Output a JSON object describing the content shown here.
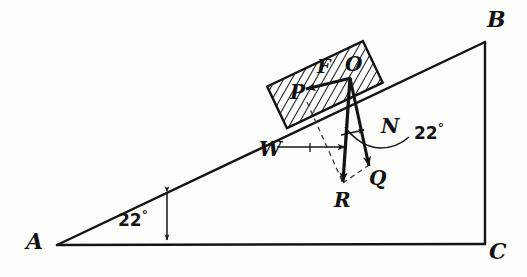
{
  "figure": {
    "background_color": "#fdfdfc",
    "stroke_color": "#141414",
    "block_fill_color": "#ffffff",
    "hatch_color": "#1a1a1a"
  },
  "vertices": {
    "A": {
      "label": "A",
      "x": 57,
      "y": 245
    },
    "B": {
      "label": "B",
      "x": 485,
      "y": 42
    },
    "C": {
      "label": "C",
      "x": 485,
      "y": 244
    },
    "O": {
      "label": "O",
      "x": 350,
      "y": 78
    }
  },
  "angles": {
    "slope": {
      "label": "22",
      "degree_symbol": "°",
      "value": 22,
      "at": "A"
    },
    "force": {
      "label": "22",
      "degree_symbol": "°",
      "value": 22,
      "at": "O"
    }
  },
  "vectors": [
    {
      "name": "F",
      "label": "F",
      "description": "friction force up the incline",
      "style": "solid"
    },
    {
      "name": "P",
      "label": "P",
      "description": "arrowhead of friction vector",
      "style": "solid"
    },
    {
      "name": "N",
      "label": "N",
      "description": "normal force component",
      "style": "solid"
    },
    {
      "name": "Q",
      "label": "Q",
      "description": "resultant along normal direction",
      "style": "solid"
    },
    {
      "name": "R",
      "label": "R",
      "description": "vertical weight vector",
      "style": "solid"
    },
    {
      "name": "W",
      "label": "W",
      "description": "weight leader arrow",
      "style": "solid"
    }
  ],
  "block": {
    "label": "hatched block on incline",
    "tilt_degrees": 22,
    "hatch_pattern": "diagonal"
  }
}
